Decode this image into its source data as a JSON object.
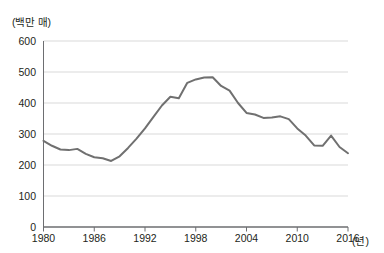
{
  "chart_data": {
    "type": "line",
    "title": "",
    "subtitle": "",
    "xlabel": "(년)",
    "ylabel": "(백만 매)",
    "y_unit_label": "(백만 매)",
    "x_unit_label": "(년)",
    "grid": "horizontal",
    "legend": "none",
    "line_color": "#707070",
    "axis_color": "#6d6e71",
    "grid_color": "#d9d9d9",
    "xlim": [
      1980,
      2016
    ],
    "ylim": [
      0,
      600
    ],
    "yticks": [
      0,
      100,
      200,
      300,
      400,
      500,
      600
    ],
    "ytick_labels": [
      "0",
      "100",
      "200",
      "300",
      "400",
      "500",
      "600"
    ],
    "xticks": [
      1980,
      1986,
      1992,
      1998,
      2004,
      2010,
      2016
    ],
    "xtick_labels": [
      "1980",
      "1986",
      "1992",
      "1998",
      "2004",
      "2010",
      "2016"
    ],
    "x": [
      1980,
      1981,
      1982,
      1983,
      1984,
      1985,
      1986,
      1987,
      1988,
      1989,
      1990,
      1991,
      1992,
      1993,
      1994,
      1995,
      1996,
      1997,
      1998,
      1999,
      2000,
      2001,
      2002,
      2003,
      2004,
      2005,
      2006,
      2007,
      2008,
      2009,
      2010,
      2011,
      2012,
      2013,
      2014,
      2015,
      2016
    ],
    "values": [
      278,
      262,
      250,
      248,
      252,
      236,
      225,
      222,
      213,
      228,
      255,
      285,
      318,
      355,
      392,
      420,
      415,
      465,
      476,
      482,
      483,
      455,
      440,
      400,
      368,
      363,
      352,
      353,
      357,
      348,
      318,
      295,
      263,
      262,
      295,
      258,
      238
    ],
    "series": [
      {
        "name": "판매량",
        "values": [
          278,
          262,
          250,
          248,
          252,
          236,
          225,
          222,
          213,
          228,
          255,
          285,
          318,
          355,
          392,
          420,
          415,
          465,
          476,
          482,
          483,
          455,
          440,
          400,
          368,
          363,
          352,
          353,
          357,
          348,
          318,
          295,
          263,
          262,
          295,
          258,
          238
        ]
      }
    ],
    "annotations": [
      {
        "label": "peak",
        "x": 2000,
        "y": 483
      },
      {
        "label": "trough",
        "x": 1988,
        "y": 213
      },
      {
        "label": "local-spike",
        "x": 2014,
        "y": 295
      },
      {
        "label": "end",
        "x": 2016,
        "y": 218
      }
    ]
  }
}
